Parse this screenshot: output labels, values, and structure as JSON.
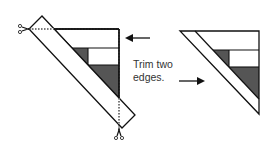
{
  "diagram": {
    "caption_line1": "Trim two",
    "caption_line2": "edges.",
    "colors": {
      "stroke": "#111111",
      "dark_fill": "#555555",
      "light_fill": "#ffffff"
    },
    "figures": [
      {
        "name": "before-trim",
        "description": "Pieced triangle with oversized strip; dotted cut lines with scissors at two corners"
      },
      {
        "name": "after-trim",
        "description": "Trimmed pieced triangle"
      }
    ],
    "icons": [
      "scissors-icon",
      "scissors-icon",
      "arrow-left-icon",
      "arrow-right-icon"
    ]
  }
}
